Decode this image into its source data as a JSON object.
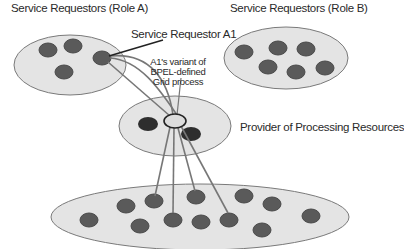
{
  "labels": {
    "role_a": "Service Requestors (Role A)",
    "role_b": "Service Requestors (Role B)",
    "requestor_a1": "Service Requestor A1",
    "variant_line1": "A1's variant of",
    "variant_line2": "BPEL-defined",
    "variant_line3": "Grid process",
    "provider": "Provider of Processing Resources"
  },
  "colors": {
    "ellipse_fill": "#e4e4e4",
    "ellipse_stroke": "#7a7a7a",
    "node_fill": "#5a5a5a",
    "node_dark_fill": "#2e2e2e",
    "hub_fill": "#dcdcdc",
    "link_stroke": "#777777"
  },
  "groups": [
    {
      "name": "role-a",
      "cx": 70,
      "cy": 65,
      "rx": 56,
      "ry": 30,
      "nodes": [
        [
          48,
          50
        ],
        [
          73,
          46
        ],
        [
          102,
          57
        ],
        [
          64,
          72
        ]
      ]
    },
    {
      "name": "role-b",
      "cx": 286,
      "cy": 58,
      "rx": 62,
      "ry": 31,
      "nodes": [
        [
          244,
          52
        ],
        [
          278,
          48
        ],
        [
          306,
          49
        ],
        [
          268,
          67
        ],
        [
          296,
          72
        ],
        [
          325,
          68
        ]
      ]
    },
    {
      "name": "provider",
      "cx": 175,
      "cy": 125,
      "rx": 56,
      "ry": 30,
      "nodes": [
        [
          148,
          124
        ],
        [
          191,
          134
        ]
      ]
    },
    {
      "name": "resources",
      "cx": 200,
      "cy": 217,
      "rx": 149,
      "ry": 33,
      "nodes": [
        [
          89,
          220
        ],
        [
          126,
          206
        ],
        [
          154,
          201
        ],
        [
          140,
          226
        ],
        [
          173,
          220
        ],
        [
          196,
          197
        ],
        [
          201,
          222
        ],
        [
          229,
          220
        ],
        [
          244,
          196
        ],
        [
          272,
          204
        ],
        [
          262,
          230
        ],
        [
          311,
          216
        ]
      ]
    }
  ]
}
